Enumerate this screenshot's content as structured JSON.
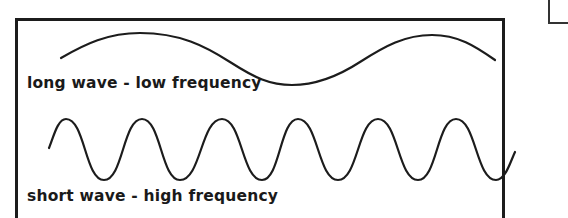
{
  "diagram": {
    "stroke_color": "#1c1c1c",
    "background": "#ffffff",
    "long_wave": {
      "label": "long wave - low frequency",
      "cycles_visible": 1,
      "peaks": [
        [
          133,
          33
        ],
        [
          430,
          35
        ]
      ],
      "troughs": [
        [
          290,
          84
        ]
      ],
      "start": [
        61,
        58
      ],
      "end": [
        495,
        60
      ]
    },
    "short_wave": {
      "label": "short wave - high frequency",
      "cycles_visible": 6,
      "peaks_x": [
        66,
        142,
        222,
        298,
        378,
        456
      ],
      "troughs_x": [
        104,
        180,
        262,
        338,
        418,
        496
      ],
      "peak_y": 119,
      "trough_y": 180,
      "start": [
        49,
        148
      ],
      "end": [
        515,
        152
      ]
    }
  }
}
